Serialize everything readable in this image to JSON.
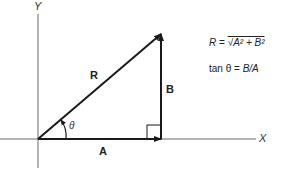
{
  "diagram": {
    "axes": {
      "x_label": "X",
      "y_label": "Y"
    },
    "vectors": {
      "resultant": {
        "label": "R"
      },
      "horizontal": {
        "label": "A"
      },
      "vertical": {
        "label": "B"
      }
    },
    "angle": {
      "symbol": "θ"
    },
    "equations": {
      "magnitude": {
        "lhs": "R",
        "equals": "=",
        "rhs": "√A² + B²"
      },
      "direction": {
        "lhs": "tan θ",
        "equals": "=",
        "rhs": "B/A"
      }
    },
    "colors": {
      "line": "#1a1a1a",
      "axis": "#555555",
      "background": "#ffffff"
    }
  }
}
